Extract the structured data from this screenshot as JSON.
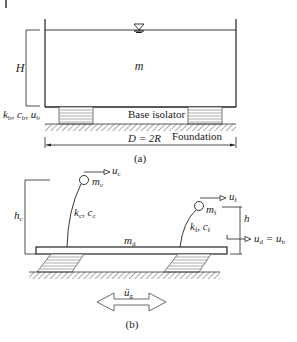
{
  "figure_a": {
    "caption": "(a)",
    "mass_label": "m",
    "height_label": "H",
    "isolator_params": "k_b, c_b, u_b",
    "isolator_k": "k",
    "isolator_k_sub": "b",
    "isolator_c": "c",
    "isolator_c_sub": "b",
    "isolator_u": "u",
    "isolator_u_sub": "b",
    "base_isolator_label": "Base isolator",
    "foundation_label": "Foundation",
    "diameter_label": "D = 2R"
  },
  "figure_b": {
    "caption": "(b)",
    "convective_mass": "m",
    "convective_mass_sub": "c",
    "convective_disp": "u",
    "convective_disp_sub": "c",
    "convective_stiffness": "k",
    "convective_stiffness_sub": "c",
    "convective_damping": "c",
    "convective_damping_sub": "c",
    "convective_height": "h",
    "convective_height_sub": "c",
    "flexible_mass": "m",
    "flexible_mass_sub": "f",
    "flexible_disp": "u",
    "flexible_disp_sub": "f",
    "flexible_stiffness": "k",
    "flexible_stiffness_sub": "f",
    "flexible_damping": "c",
    "flexible_damping_sub": "f",
    "flexible_height": "h",
    "deck_mass": "m",
    "deck_mass_sub": "d",
    "deck_disp": "u",
    "deck_disp_sub": "d",
    "deck_eq": " = u",
    "deck_eq_sub": "b",
    "ground_accel": "ü",
    "ground_accel_sub": "g"
  },
  "colors": {
    "line": "#222222",
    "hatch": "#555555",
    "pad": "#888888"
  }
}
